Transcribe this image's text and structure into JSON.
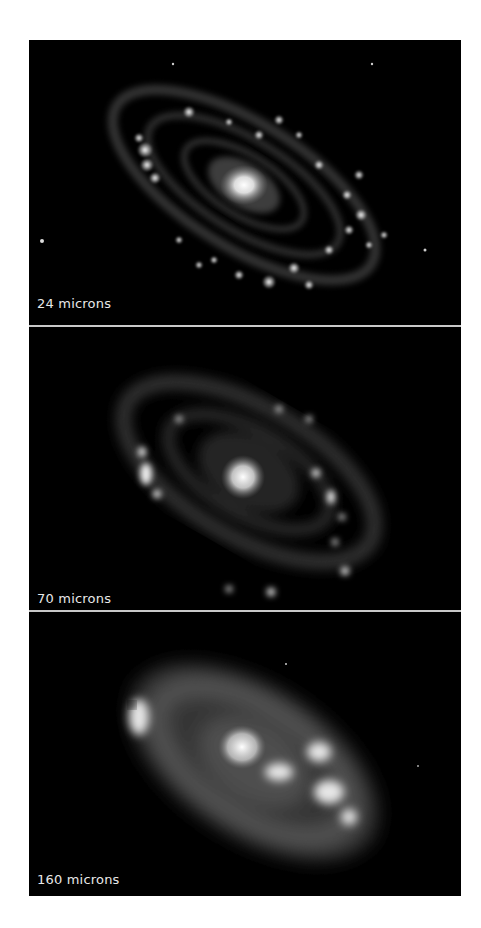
{
  "figure": {
    "panels": [
      {
        "label": "24 microns"
      },
      {
        "label": "70 microns"
      },
      {
        "label": "160 microns"
      }
    ]
  }
}
